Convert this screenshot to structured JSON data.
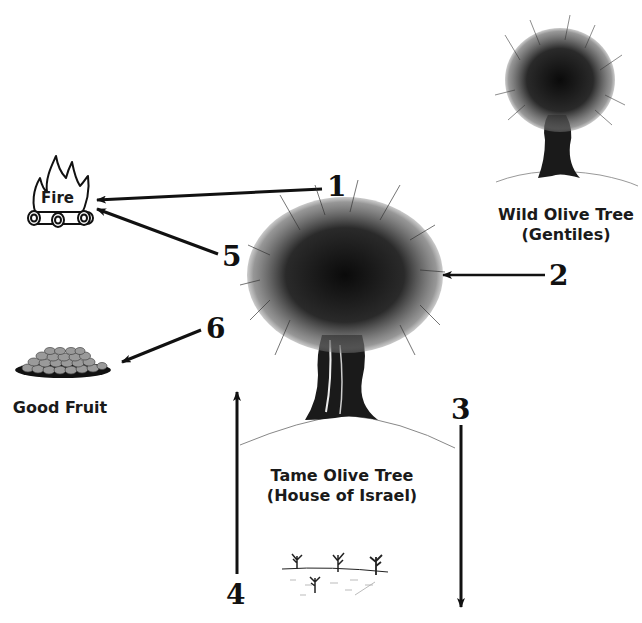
{
  "diagram": {
    "nodes": {
      "fire": {
        "label": "Fire",
        "icon": "fire-icon"
      },
      "good_fruit": {
        "label": "Good Fruit",
        "icon": "fruit-bowl-icon"
      },
      "wild_olive_tree": {
        "title": "Wild Olive Tree",
        "subtitle": "(Gentiles)",
        "icon": "wild-olive-tree-icon"
      },
      "tame_olive_tree": {
        "title": "Tame Olive Tree",
        "subtitle": "(House of Israel)",
        "icon": "tame-olive-tree-icon"
      },
      "saplings": {
        "icon": "saplings-icon"
      }
    },
    "arrows": [
      {
        "id": "1",
        "label": "1",
        "from": "tame_olive_tree",
        "to": "fire"
      },
      {
        "id": "2",
        "label": "2",
        "from": "label-2",
        "to": "tame_olive_tree"
      },
      {
        "id": "3",
        "label": "3",
        "from": "tame_olive_tree",
        "to": "bottom"
      },
      {
        "id": "4",
        "label": "4",
        "from": "bottom",
        "to": "tame_olive_tree"
      },
      {
        "id": "5",
        "label": "5",
        "from": "tame_olive_tree",
        "to": "fire"
      },
      {
        "id": "6",
        "label": "6",
        "from": "tame_olive_tree",
        "to": "good_fruit"
      }
    ],
    "colors": {
      "ink": "#111111",
      "fruit": "#9a9a9a",
      "background": "#ffffff"
    }
  }
}
